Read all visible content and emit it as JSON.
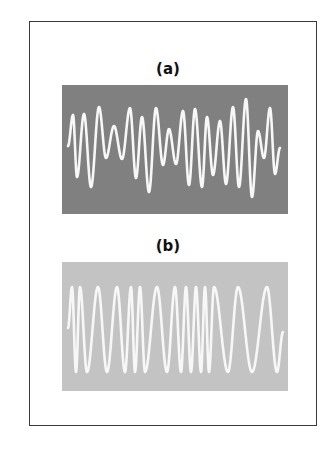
{
  "figure": {
    "frame_color": "#3a3a3a",
    "stroke_color": "#f7f7f7",
    "panels": [
      {
        "label": "(a)",
        "label_y": 60,
        "top": 85,
        "background": "#808080",
        "description": "amplitude-modulated waveform",
        "extrema": [
          [
            68,
            146
          ],
          [
            73,
            115
          ],
          [
            77,
            177
          ],
          [
            84,
            114
          ],
          [
            91,
            187
          ],
          [
            99,
            107
          ],
          [
            106,
            158
          ],
          [
            114,
            126
          ],
          [
            122,
            159
          ],
          [
            130,
            108
          ],
          [
            136,
            178
          ],
          [
            142,
            117
          ],
          [
            149,
            192
          ],
          [
            156,
            108
          ],
          [
            163,
            165
          ],
          [
            169,
            129
          ],
          [
            176,
            164
          ],
          [
            183,
            111
          ],
          [
            189,
            185
          ],
          [
            195,
            109
          ],
          [
            202,
            187
          ],
          [
            207,
            117
          ],
          [
            213,
            175
          ],
          [
            220,
            121
          ],
          [
            226,
            184
          ],
          [
            233,
            107
          ],
          [
            239,
            187
          ],
          [
            246,
            99
          ],
          [
            252,
            197
          ],
          [
            258,
            131
          ],
          [
            264,
            158
          ],
          [
            270,
            108
          ],
          [
            275,
            174
          ],
          [
            280,
            148
          ]
        ]
      },
      {
        "label": "(b)",
        "label_y": 237,
        "top": 262,
        "background": "#c3c3c3",
        "description": "frequency-modulated waveform",
        "extrema": [
          [
            68,
            328
          ],
          [
            72,
            287
          ],
          [
            76,
            372
          ],
          [
            80,
            287
          ],
          [
            87,
            372
          ],
          [
            98,
            287
          ],
          [
            107,
            372
          ],
          [
            117,
            287
          ],
          [
            125,
            372
          ],
          [
            131,
            287
          ],
          [
            135,
            372
          ],
          [
            140,
            287
          ],
          [
            145,
            372
          ],
          [
            157,
            287
          ],
          [
            167,
            372
          ],
          [
            175,
            287
          ],
          [
            181,
            372
          ],
          [
            186,
            287
          ],
          [
            191,
            372
          ],
          [
            196,
            287
          ],
          [
            201,
            372
          ],
          [
            205,
            287
          ],
          [
            209,
            372
          ],
          [
            214,
            287
          ],
          [
            228,
            372
          ],
          [
            238,
            287
          ],
          [
            252,
            372
          ],
          [
            267,
            287
          ],
          [
            277,
            372
          ],
          [
            283,
            332
          ]
        ]
      }
    ]
  }
}
